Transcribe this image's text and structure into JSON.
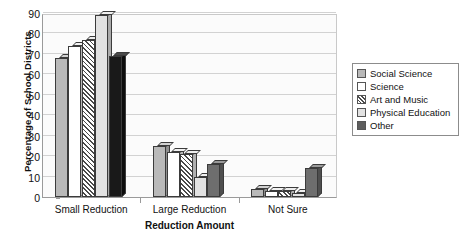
{
  "chart_data": {
    "type": "bar",
    "title": "",
    "xlabel": "Reduction Amount",
    "ylabel": "Percentage of School Districts",
    "categories": [
      "Small Reduction",
      "Large Reduction",
      "Not Sure"
    ],
    "series": [
      {
        "name": "Social Science",
        "values": [
          68,
          25,
          4
        ]
      },
      {
        "name": "Science",
        "values": [
          74,
          22,
          3
        ]
      },
      {
        "name": "Art and Music",
        "values": [
          77,
          21,
          3
        ]
      },
      {
        "name": "Physical Education",
        "values": [
          89,
          10,
          2
        ]
      },
      {
        "name": "Other",
        "values": [
          69,
          16,
          14
        ]
      }
    ],
    "ylim": [
      0,
      90
    ],
    "yticks": [
      0,
      10,
      20,
      30,
      40,
      50,
      60,
      70,
      80,
      90
    ],
    "ytick_labels": [
      "0",
      "10",
      "20",
      "30",
      "40",
      "50",
      "60",
      "70",
      "80",
      "90"
    ],
    "grid": true,
    "legend_position": "right",
    "legend_entries": [
      "Social Science",
      "Science",
      "Art and Music",
      "Physical Education",
      "Other"
    ],
    "swatch_styles": [
      "solid-gray",
      "white",
      "diagonal-hatch",
      "light-gray",
      "dark-solid"
    ]
  }
}
